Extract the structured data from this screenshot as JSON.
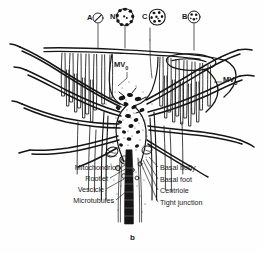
{
  "figure": {
    "caption": "b"
  },
  "insets": [
    {
      "id": "A",
      "label": "A",
      "icon": "circle-cross-section-icon",
      "x": 88,
      "y": 15,
      "cx": 98,
      "cy": 18,
      "r": 5.0,
      "leader_to_y": 48,
      "pattern": "slash"
    },
    {
      "id": "N",
      "label": "N",
      "icon": "axoneme-cross-section-icon",
      "x": 111,
      "y": 18,
      "cx": 125,
      "cy": 17,
      "r": 8.5,
      "leader_to_y": 48,
      "pattern": "ring9"
    },
    {
      "id": "C",
      "label": "C",
      "icon": "centriole-cross-section-icon",
      "x": 142,
      "y": 18,
      "cx": 157,
      "cy": 17,
      "r": 8.0,
      "leader_to_y": 78,
      "pattern": "blobs"
    },
    {
      "id": "B",
      "label": "B",
      "icon": "basal-body-cross-section-icon",
      "x": 182,
      "y": 17,
      "cx": 194,
      "cy": 17,
      "r": 6.0,
      "leader_to_y": 50,
      "pattern": "dots"
    }
  ],
  "structure_labels": {
    "mv0": {
      "text": "MV",
      "sub": "0",
      "x": 116,
      "y": 64
    },
    "mv3": {
      "text": "MV",
      "sub": "3",
      "x": 224,
      "y": 80
    }
  },
  "callouts_left": [
    {
      "label": "Mitochondrion",
      "x": 56,
      "y": 170,
      "tip_x": 122,
      "tip_y": 161
    },
    {
      "label": "Rootlet",
      "x": 78,
      "y": 181,
      "tip_x": 124,
      "tip_y": 172
    },
    {
      "label": "Vescicle",
      "x": 74,
      "y": 192,
      "tip_x": 125,
      "tip_y": 185
    },
    {
      "label": "Microtubules",
      "x": 58,
      "y": 203,
      "tip_x": 127,
      "tip_y": 196
    }
  ],
  "callouts_right": [
    {
      "label": "Basal body",
      "x": 161,
      "y": 170,
      "tip_x": 150,
      "tip_y": 157
    },
    {
      "label": "Basal foot",
      "x": 161,
      "y": 182,
      "tip_x": 147,
      "tip_y": 160
    },
    {
      "label": "Centriole",
      "x": 161,
      "y": 193,
      "tip_x": 144,
      "tip_y": 162
    },
    {
      "label": "Tight junction",
      "x": 161,
      "y": 205,
      "tip_x": 141,
      "tip_y": 163
    }
  ],
  "colors": {
    "ink": "#151515",
    "stipple": "#2b2b2b",
    "paper": "#fefefe",
    "leader": "#1a1a1a"
  }
}
